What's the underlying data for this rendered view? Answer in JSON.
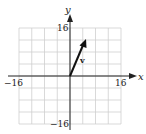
{
  "chart_data": {
    "type": "line",
    "title": "",
    "xlabel": "x",
    "ylabel": "y",
    "xlim": [
      -16,
      16
    ],
    "ylim": [
      -16,
      16
    ],
    "grid": true,
    "grid_step": 4,
    "x_tick_labels": [
      "-16",
      "16"
    ],
    "y_tick_labels": [
      "16",
      "-16"
    ],
    "series": [
      {
        "name": "v",
        "kind": "vector",
        "from": [
          0,
          0
        ],
        "to": [
          5,
          12
        ]
      }
    ],
    "annotations": [
      {
        "text": "v",
        "x": 4,
        "y": 6
      }
    ]
  },
  "labels": {
    "x_axis": "x",
    "y_axis": "y",
    "x_min": "−16",
    "x_max": "16",
    "y_max": "16",
    "y_min": "−16",
    "vector": "v"
  },
  "colors": {
    "grid": "#cfcfcf",
    "axis": "#222222",
    "vector": "#111111"
  }
}
